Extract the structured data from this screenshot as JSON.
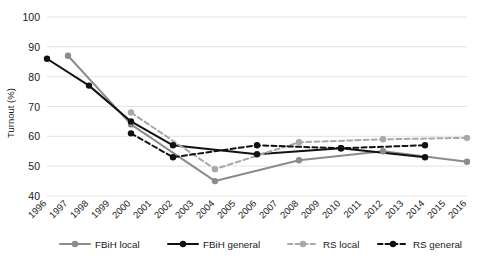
{
  "chart_data": {
    "type": "line",
    "title": "",
    "xlabel": "",
    "ylabel": "Turnout (%)",
    "ylim": [
      40,
      100
    ],
    "yticks": [
      40,
      50,
      60,
      70,
      80,
      90,
      100
    ],
    "grid": true,
    "legend_position": "bottom",
    "categories": [
      "1996",
      "1997",
      "1998",
      "1999",
      "2000",
      "2001",
      "2002",
      "2003",
      "2004",
      "2005",
      "2006",
      "2007",
      "2008",
      "2009",
      "2010",
      "2011",
      "2012",
      "2013",
      "2014",
      "2015",
      "2016"
    ],
    "series": [
      {
        "name": "FBiH local",
        "color": "#8c8c8c",
        "style": "solid",
        "marker": "circle",
        "points": [
          {
            "x": "1997",
            "y": 87
          },
          {
            "x": "2000",
            "y": 64
          },
          {
            "x": "2004",
            "y": 45
          },
          {
            "x": "2008",
            "y": 52
          },
          {
            "x": "2012",
            "y": 55
          },
          {
            "x": "2016",
            "y": 51.5
          }
        ]
      },
      {
        "name": "FBiH general",
        "color": "#111111",
        "style": "solid",
        "marker": "circle",
        "points": [
          {
            "x": "1996",
            "y": 86
          },
          {
            "x": "1998",
            "y": 77
          },
          {
            "x": "2000",
            "y": 65
          },
          {
            "x": "2002",
            "y": 57
          },
          {
            "x": "2006",
            "y": 54
          },
          {
            "x": "2010",
            "y": 56
          },
          {
            "x": "2014",
            "y": 53
          }
        ]
      },
      {
        "name": "RS local",
        "color": "#a8a8a8",
        "style": "dashed",
        "marker": "circle",
        "points": [
          {
            "x": "2000",
            "y": 68
          },
          {
            "x": "2004",
            "y": 49
          },
          {
            "x": "2008",
            "y": 58
          },
          {
            "x": "2012",
            "y": 59
          },
          {
            "x": "2016",
            "y": 59.5
          }
        ]
      },
      {
        "name": "RS general",
        "color": "#111111",
        "style": "dashed",
        "marker": "circle",
        "points": [
          {
            "x": "2000",
            "y": 61
          },
          {
            "x": "2002",
            "y": 53
          },
          {
            "x": "2006",
            "y": 57
          },
          {
            "x": "2010",
            "y": 56
          },
          {
            "x": "2014",
            "y": 57
          }
        ]
      }
    ]
  },
  "legend": {
    "items": [
      {
        "label": "FBiH local"
      },
      {
        "label": "FBiH general"
      },
      {
        "label": "RS local"
      },
      {
        "label": "RS general"
      }
    ]
  },
  "caption": {
    "text": ""
  }
}
